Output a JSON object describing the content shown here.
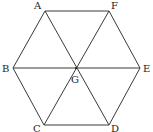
{
  "diagram": {
    "title": "",
    "shape": "regular hexagon with center G",
    "vertices": [
      {
        "id": "A",
        "label": "A",
        "x": 45,
        "y": 11,
        "lx": 34,
        "ly": 9
      },
      {
        "id": "F",
        "label": "F",
        "x": 109,
        "y": 11,
        "lx": 111,
        "ly": 9
      },
      {
        "id": "E",
        "label": "E",
        "x": 140,
        "y": 68,
        "lx": 143,
        "ly": 72
      },
      {
        "id": "D",
        "label": "D",
        "x": 109,
        "y": 125,
        "lx": 111,
        "ly": 132
      },
      {
        "id": "C",
        "label": "C",
        "x": 44,
        "y": 125,
        "lx": 33,
        "ly": 132
      },
      {
        "id": "B",
        "label": "B",
        "x": 13,
        "y": 68,
        "lx": 2,
        "ly": 72
      },
      {
        "id": "G",
        "label": "G",
        "x": 76,
        "y": 68,
        "lx": 71,
        "ly": 83
      }
    ],
    "edges": [
      [
        "A",
        "F"
      ],
      [
        "F",
        "E"
      ],
      [
        "E",
        "D"
      ],
      [
        "D",
        "C"
      ],
      [
        "C",
        "B"
      ],
      [
        "B",
        "A"
      ],
      [
        "A",
        "D"
      ],
      [
        "F",
        "C"
      ],
      [
        "B",
        "E"
      ]
    ],
    "stroke_color": "#3a3a3a"
  }
}
